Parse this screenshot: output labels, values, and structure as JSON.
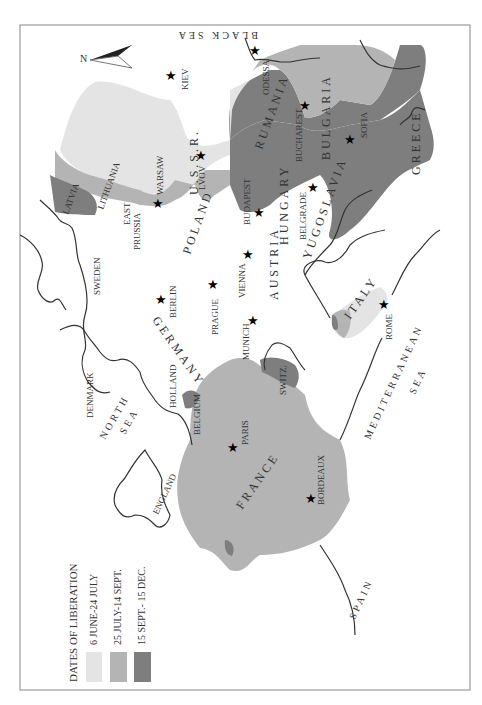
{
  "map": {
    "orientation": "rotated 90° counter-clockwise",
    "north_arrow": {
      "label": "N"
    },
    "colors": {
      "period_1": "#e4e4e4",
      "period_2": "#b4b4b4",
      "period_3": "#7e7e7e",
      "coast": "#333333",
      "frame": "#888888"
    },
    "legend": {
      "title": "DATES OF LIBERATION",
      "items": [
        {
          "label": "6 JUNE-24 JULY",
          "color": "#e4e4e4"
        },
        {
          "label": "25 JULY-14 SEPT.",
          "color": "#b4b4b4"
        },
        {
          "label": "15 SEPT.- 15 DEC.",
          "color": "#7e7e7e"
        }
      ]
    },
    "countries": {
      "ussr": "U.S.S.R.",
      "poland": "POLAND",
      "lithuania": "LITHUANIA",
      "latvia": "LATVIA",
      "east_prussia_1": "EAST",
      "east_prussia_2": "PRUSSIA",
      "sweden": "SWEDEN",
      "denmark": "DENMARK",
      "germany": "GERMANY",
      "holland": "HOLLAND",
      "belgium": "BELGIUM",
      "france": "FRANCE",
      "england": "ENGLAND",
      "spain": "SPAIN",
      "switz": "SWITZ.",
      "austria": "AUSTRIA",
      "hungary": "HUNGARY",
      "yugoslavia": "YUGOSLAVIA",
      "rumania": "RUMANIA",
      "bulgaria": "BULGARIA",
      "greece": "GREECE",
      "italy": "ITALY"
    },
    "seas": {
      "black_sea": "BLACK SEA",
      "north_sea_1": "NORTH",
      "north_sea_2": "SEA",
      "med_1": "MEDITERRANEAN",
      "med_2": "SEA"
    },
    "cities": {
      "kiev": "KIEV",
      "odessa": "ODESSA",
      "warsaw": "WARSAW",
      "lvov": "LVOV",
      "bucharest": "BUCHAREST",
      "sofia": "SOFIA",
      "budapest": "BUDAPEST",
      "belgrade": "BELGRADE",
      "berlin": "BERLIN",
      "prague": "PRAGUE",
      "vienna": "VIENNA",
      "munich": "MUNICH",
      "paris": "PARIS",
      "bordeaux": "BORDEAUX",
      "rome": "ROME"
    }
  }
}
